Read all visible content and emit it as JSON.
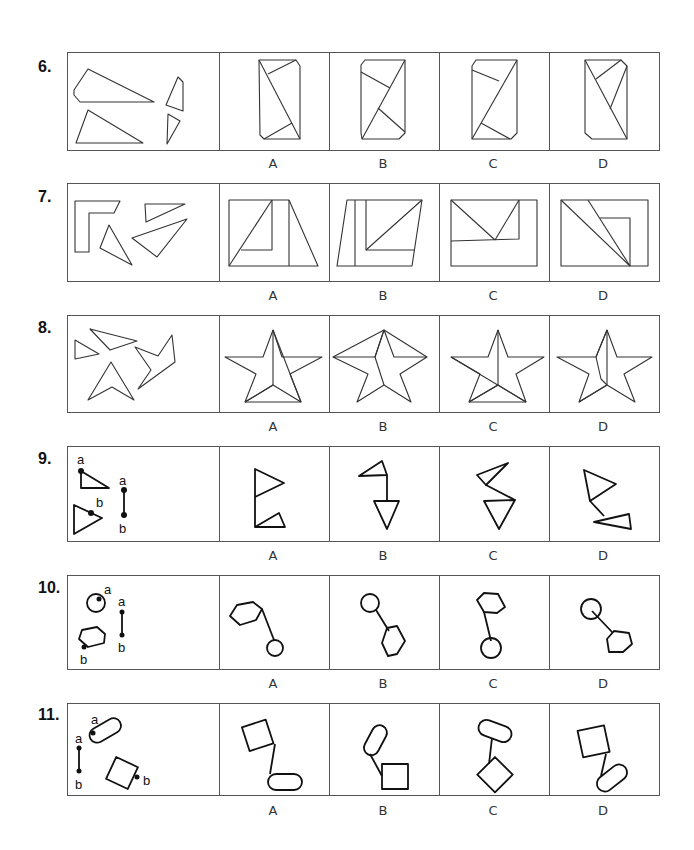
{
  "questions": [
    {
      "number": "6.",
      "options": [
        "A",
        "B",
        "C",
        "D"
      ],
      "stimulus": "four loose polygon pieces (two triangles, two quadrilaterals)",
      "theme": "assemble pieces into rectangle with cut corners"
    },
    {
      "number": "7.",
      "options": [
        "A",
        "B",
        "C",
        "D"
      ],
      "stimulus": "L-shape and three triangles",
      "theme": "assemble pieces into rectangle"
    },
    {
      "number": "8.",
      "options": [
        "A",
        "B",
        "C",
        "D"
      ],
      "stimulus": "four star fragments",
      "theme": "assemble pieces into five-pointed star"
    },
    {
      "number": "9.",
      "options": [
        "A",
        "B",
        "C",
        "D"
      ],
      "stimulus": "two triangles and connector a-b",
      "point_labels": [
        "a",
        "b",
        "a",
        "b"
      ],
      "theme": "join shapes at points a and b"
    },
    {
      "number": "10.",
      "options": [
        "A",
        "B",
        "C",
        "D"
      ],
      "stimulus": "circle, hexagon and connector a-b",
      "point_labels": [
        "a",
        "b",
        "a",
        "b"
      ],
      "theme": "join shapes at points a and b"
    },
    {
      "number": "11.",
      "options": [
        "A",
        "B",
        "C",
        "D"
      ],
      "stimulus": "rounded capsule, square and connector a-b",
      "point_labels": [
        "a",
        "b",
        "a",
        "b"
      ],
      "theme": "join shapes at points a and b"
    }
  ],
  "colors": {
    "line": "#333333",
    "frame": "#555555",
    "background": "#ffffff"
  }
}
